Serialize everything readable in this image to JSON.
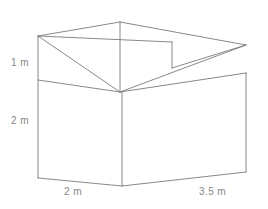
{
  "figure": {
    "title": "",
    "type": "3d-solid-diagram",
    "shape": "shed-with-slanted-roof",
    "stroke_color": "#7a7a7a",
    "label_color": "#878787",
    "background": "#ffffff",
    "stroke_width": 0.9,
    "labels": {
      "height_top": "1 m",
      "height_side": "2 m",
      "depth": "2 m",
      "width": "3.5 m"
    },
    "vertices": {
      "front_top_left": [
        38,
        36
      ],
      "front_mid_left": [
        38,
        80
      ],
      "front_bottom_left": [
        38,
        178
      ],
      "front_top_right": [
        120,
        22
      ],
      "front_mid_right": [
        120,
        92
      ],
      "front_bottom_right": [
        122,
        186
      ],
      "back_top_far": [
        246,
        45
      ],
      "back_mid_right": [
        246,
        73
      ],
      "back_bottom_right": [
        246,
        172
      ],
      "roof_notch_top": [
        172,
        42
      ],
      "roof_notch_bottom": [
        172,
        68
      ]
    },
    "edges": [
      {
        "name": "front-face-left-edge",
        "from": [
          38,
          36
        ],
        "to": [
          38,
          178
        ]
      },
      {
        "name": "front-face-top-edge",
        "from": [
          38,
          36
        ],
        "to": [
          120,
          22
        ]
      },
      {
        "name": "front-face-mid-edge",
        "from": [
          38,
          80
        ],
        "to": [
          120,
          92
        ]
      },
      {
        "name": "front-face-bottom-edge",
        "from": [
          38,
          178
        ],
        "to": [
          122,
          186
        ]
      },
      {
        "name": "front-face-right-edge",
        "from": [
          120,
          22
        ],
        "to": [
          120,
          92
        ]
      },
      {
        "name": "front-face-diagonal",
        "from": [
          38,
          36
        ],
        "to": [
          120,
          92
        ]
      },
      {
        "name": "front-vertical-lower",
        "from": [
          122,
          92
        ],
        "to": [
          122,
          186
        ]
      },
      {
        "name": "roof-back-edge",
        "from": [
          120,
          22
        ],
        "to": [
          246,
          45
        ]
      },
      {
        "name": "roof-slope-edge",
        "from": [
          120,
          92
        ],
        "to": [
          246,
          45
        ]
      },
      {
        "name": "side-top-edge",
        "from": [
          120,
          92
        ],
        "to": [
          246,
          73
        ]
      },
      {
        "name": "side-right-edge",
        "from": [
          246,
          73
        ],
        "to": [
          246,
          172
        ]
      },
      {
        "name": "side-bottom-edge",
        "from": [
          122,
          186
        ],
        "to": [
          246,
          172
        ]
      },
      {
        "name": "roof-notch-vertical",
        "from": [
          172,
          42
        ],
        "to": [
          172,
          68
        ]
      },
      {
        "name": "roof-notch-diagonal",
        "from": [
          172,
          68
        ],
        "to": [
          246,
          45
        ]
      },
      {
        "name": "roof-ridge-line",
        "from": [
          38,
          36
        ],
        "to": [
          172,
          42
        ]
      }
    ]
  }
}
